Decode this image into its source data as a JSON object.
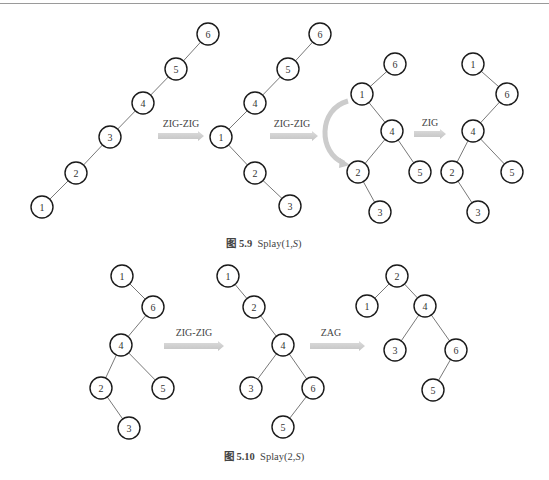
{
  "figures": [
    {
      "id": "fig-5-9",
      "caption": {
        "prefix": "图 5.9",
        "text_before": "Splay(1,",
        "var": "S",
        "text_after": ")",
        "x": 264,
        "y": 235
      },
      "trees": [
        {
          "nodes": [
            {
              "v": "6",
              "x": 208,
              "y": 34
            },
            {
              "v": "5",
              "x": 176,
              "y": 69
            },
            {
              "v": "4",
              "x": 143,
              "y": 103
            },
            {
              "v": "3",
              "x": 110,
              "y": 137
            },
            {
              "v": "2",
              "x": 76,
              "y": 173
            },
            {
              "v": "1",
              "x": 42,
              "y": 207
            }
          ],
          "edges": [
            [
              "6",
              "5"
            ],
            [
              "5",
              "4"
            ],
            [
              "4",
              "3"
            ],
            [
              "3",
              "2"
            ],
            [
              "2",
              "1"
            ]
          ]
        },
        {
          "nodes": [
            {
              "v": "6",
              "x": 320,
              "y": 34
            },
            {
              "v": "5",
              "x": 288,
              "y": 69
            },
            {
              "v": "4",
              "x": 255,
              "y": 103
            },
            {
              "v": "1",
              "x": 221,
              "y": 137
            },
            {
              "v": "2",
              "x": 255,
              "y": 173
            },
            {
              "v": "3",
              "x": 290,
              "y": 206
            }
          ],
          "edges": [
            [
              "6",
              "5"
            ],
            [
              "5",
              "4"
            ],
            [
              "4",
              "1"
            ],
            [
              "1",
              "2"
            ],
            [
              "2",
              "3"
            ]
          ]
        },
        {
          "nodes": [
            {
              "v": "6",
              "x": 395,
              "y": 64
            },
            {
              "v": "1",
              "x": 362,
              "y": 94
            },
            {
              "v": "4",
              "x": 392,
              "y": 131
            },
            {
              "v": "2",
              "x": 358,
              "y": 172
            },
            {
              "v": "5",
              "x": 420,
              "y": 172
            },
            {
              "v": "3",
              "x": 380,
              "y": 212
            }
          ],
          "edges": [
            [
              "6",
              "1"
            ],
            [
              "1",
              "4"
            ],
            [
              "4",
              "2"
            ],
            [
              "4",
              "5"
            ],
            [
              "2",
              "3"
            ]
          ]
        },
        {
          "nodes": [
            {
              "v": "1",
              "x": 473,
              "y": 64
            },
            {
              "v": "6",
              "x": 507,
              "y": 94
            },
            {
              "v": "4",
              "x": 473,
              "y": 131
            },
            {
              "v": "2",
              "x": 452,
              "y": 172
            },
            {
              "v": "5",
              "x": 512,
              "y": 172
            },
            {
              "v": "3",
              "x": 478,
              "y": 212
            }
          ],
          "edges": [
            [
              "1",
              "6"
            ],
            [
              "6",
              "4"
            ],
            [
              "4",
              "2"
            ],
            [
              "4",
              "5"
            ],
            [
              "2",
              "3"
            ]
          ]
        }
      ],
      "operations": [
        {
          "label": "ZIG-ZIG",
          "x1": 158,
          "x2": 204,
          "y": 136,
          "lx": 181,
          "ly": 127
        },
        {
          "label": "ZIG-ZIG",
          "x1": 270,
          "x2": 318,
          "y": 136,
          "lx": 292,
          "ly": 127
        },
        {
          "label": "ZIG",
          "x1": 414,
          "x2": 446,
          "y": 134,
          "lx": 430,
          "ly": 126
        }
      ],
      "curved_arrow": {
        "x1": 348,
        "y1": 101,
        "x2": 348,
        "y2": 165
      }
    },
    {
      "id": "fig-5-10",
      "caption": {
        "prefix": "图 5.10",
        "text_before": "Splay(2,",
        "var": "S",
        "text_after": ")",
        "x": 264,
        "y": 448
      },
      "trees": [
        {
          "nodes": [
            {
              "v": "1",
              "x": 122,
              "y": 276
            },
            {
              "v": "6",
              "x": 153,
              "y": 307
            },
            {
              "v": "4",
              "x": 121,
              "y": 345
            },
            {
              "v": "2",
              "x": 101,
              "y": 388
            },
            {
              "v": "5",
              "x": 163,
              "y": 388
            },
            {
              "v": "3",
              "x": 129,
              "y": 428
            }
          ],
          "edges": [
            [
              "1",
              "6"
            ],
            [
              "6",
              "4"
            ],
            [
              "4",
              "2"
            ],
            [
              "4",
              "5"
            ],
            [
              "2",
              "3"
            ]
          ]
        },
        {
          "nodes": [
            {
              "v": "1",
              "x": 228,
              "y": 276
            },
            {
              "v": "2",
              "x": 254,
              "y": 307
            },
            {
              "v": "4",
              "x": 283,
              "y": 345
            },
            {
              "v": "3",
              "x": 251,
              "y": 388
            },
            {
              "v": "6",
              "x": 313,
              "y": 388
            },
            {
              "v": "5",
              "x": 283,
              "y": 427
            }
          ],
          "edges": [
            [
              "1",
              "2"
            ],
            [
              "2",
              "4"
            ],
            [
              "4",
              "3"
            ],
            [
              "4",
              "6"
            ],
            [
              "6",
              "5"
            ]
          ]
        },
        {
          "nodes": [
            {
              "v": "2",
              "x": 397,
              "y": 276
            },
            {
              "v": "1",
              "x": 367,
              "y": 306
            },
            {
              "v": "4",
              "x": 425,
              "y": 306
            },
            {
              "v": "3",
              "x": 395,
              "y": 350
            },
            {
              "v": "6",
              "x": 456,
              "y": 350
            },
            {
              "v": "5",
              "x": 433,
              "y": 390
            }
          ],
          "edges": [
            [
              "2",
              "1"
            ],
            [
              "2",
              "4"
            ],
            [
              "4",
              "3"
            ],
            [
              "4",
              "6"
            ],
            [
              "6",
              "5"
            ]
          ]
        }
      ],
      "operations": [
        {
          "label": "ZIG-ZIG",
          "x1": 164,
          "x2": 224,
          "y": 346,
          "lx": 194,
          "ly": 336
        },
        {
          "label": "ZAG",
          "x1": 310,
          "x2": 365,
          "y": 346,
          "lx": 331,
          "ly": 336
        }
      ]
    }
  ],
  "colors": {
    "arrow": "#cfcfcf",
    "stroke": "#1a1a1a",
    "edge": "#555555"
  }
}
